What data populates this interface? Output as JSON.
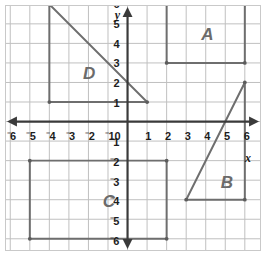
{
  "chart_data": {
    "type": "scatter",
    "title": "",
    "xlabel": "x",
    "ylabel": "y",
    "xlim": [
      -6.5,
      6.5
    ],
    "ylim": [
      -6.5,
      6.5
    ],
    "grid": true,
    "grid_spacing": 1,
    "legend": "none",
    "x_ticks": [
      "-6",
      "-5",
      "-4",
      "-3",
      "-2",
      "-1",
      "0",
      "1",
      "2",
      "3",
      "4",
      "5",
      "6"
    ],
    "y_ticks": [
      "6",
      "5",
      "4",
      "3",
      "2",
      "1",
      "-1",
      "-2",
      "-3",
      "-4",
      "-5",
      "-6"
    ],
    "notation": "negative signs rendered as raised superscript minus",
    "shapes": [
      {
        "label": "A",
        "kind": "rectangle",
        "vertices": [
          [
            2,
            6
          ],
          [
            6,
            6
          ],
          [
            6,
            3
          ],
          [
            2,
            3
          ]
        ],
        "label_position": [
          4,
          4.5
        ],
        "stroke": "#6e6e6e"
      },
      {
        "label": "B",
        "kind": "triangle",
        "vertices": [
          [
            3,
            -4
          ],
          [
            6,
            -4
          ],
          [
            6,
            2
          ]
        ],
        "label_position": [
          5,
          -3
        ],
        "stroke": "#6e6e6e"
      },
      {
        "label": "C",
        "kind": "rectangle",
        "vertices": [
          [
            -5,
            -2
          ],
          [
            2,
            -2
          ],
          [
            2,
            -6
          ],
          [
            -5,
            -6
          ]
        ],
        "label_position": [
          -1,
          -4
        ],
        "stroke": "#6e6e6e"
      },
      {
        "label": "D",
        "kind": "triangle",
        "vertices": [
          [
            -4,
            6
          ],
          [
            -4,
            1
          ],
          [
            1,
            1
          ]
        ],
        "label_position": [
          -2,
          2.5
        ],
        "stroke": "#6e6e6e"
      }
    ]
  },
  "axes": {
    "x_name": "x",
    "y_name": "y",
    "origin_label": "0",
    "axis_color": "#3a3a3a",
    "grid_color": "#bfbfbf",
    "frame_color": "#c9c9c9"
  },
  "x_tick_values": [
    -6,
    -5,
    -4,
    -3,
    -2,
    -1,
    1,
    2,
    3,
    4,
    5,
    6
  ],
  "y_tick_values": [
    6,
    5,
    4,
    3,
    2,
    1,
    -1,
    -2,
    -3,
    -4,
    -5,
    -6
  ]
}
